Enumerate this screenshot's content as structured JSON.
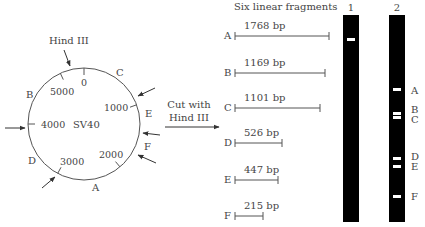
{
  "plasmid": {
    "name": "SV40",
    "enzyme_label": "Hind III",
    "ticks": [
      {
        "label": "0",
        "angle": 0
      },
      {
        "label": "1000",
        "angle": 70
      },
      {
        "label": "2000",
        "angle": 140
      },
      {
        "label": "3000",
        "angle": 208
      },
      {
        "label": "4000",
        "angle": 270
      },
      {
        "label": "5000",
        "angle": 335
      }
    ],
    "fragment_labels": [
      "A",
      "B",
      "C",
      "D",
      "E",
      "F"
    ],
    "cut_sites_count": 6
  },
  "process": {
    "line1": "Cut with",
    "line2": "Hind III"
  },
  "fragments": {
    "title": "Six linear fragments",
    "items": [
      {
        "label": "A",
        "size": "1768 bp"
      },
      {
        "label": "B",
        "size": "1169 bp"
      },
      {
        "label": "C",
        "size": "1101 bp"
      },
      {
        "label": "D",
        "size": "526 bp"
      },
      {
        "label": "E",
        "size": "447 bp"
      },
      {
        "label": "F",
        "size": "215 bp"
      }
    ]
  },
  "gel": {
    "lanes": [
      {
        "number": "1",
        "description": "uncut SV40 DNA",
        "bands": 1
      },
      {
        "number": "2",
        "description": "Hind III digest",
        "bands": 6
      }
    ],
    "lane2_band_labels": [
      "A",
      "B",
      "C",
      "D",
      "E",
      "F"
    ],
    "lane_color": "#000000",
    "band_color": "#ffffff"
  }
}
